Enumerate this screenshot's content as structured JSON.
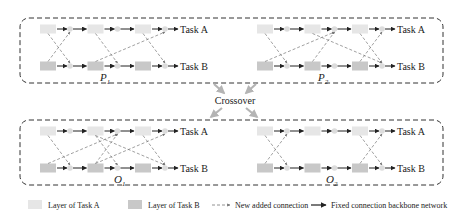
{
  "colors": {
    "layer_a": "#e6e6e6",
    "layer_b": "#c8c8c8",
    "node": "#dcdcdc",
    "border": "#333333",
    "dashed_arrow": "#777777",
    "crossover_arrow": "#b4b4b4",
    "fixed_arrow": "#222222"
  },
  "networks": [
    {
      "id": "P1",
      "label_main": "P",
      "label_sub": "1",
      "outputs": {
        "a": "Task A",
        "b": "Task B"
      },
      "added_connections": [
        {
          "from": [
            "A",
            0
          ],
          "to": [
            "B",
            0
          ]
        },
        {
          "from": [
            "B",
            0
          ],
          "to": [
            "A",
            0
          ]
        },
        {
          "from": [
            "A",
            1
          ],
          "to": [
            "B",
            1
          ]
        },
        {
          "from": [
            "B",
            1
          ],
          "to": [
            "A",
            2
          ]
        },
        {
          "from": [
            "A",
            2
          ],
          "to": [
            "B",
            2
          ]
        }
      ]
    },
    {
      "id": "P2",
      "label_main": "P",
      "label_sub": "2",
      "outputs": {
        "a": "Task A",
        "b": "Task B"
      },
      "added_connections": [
        {
          "from": [
            "A",
            0
          ],
          "to": [
            "B",
            0
          ]
        },
        {
          "from": [
            "B",
            0
          ],
          "to": [
            "A",
            1
          ]
        },
        {
          "from": [
            "B",
            1
          ],
          "to": [
            "A",
            1
          ]
        },
        {
          "from": [
            "A",
            1
          ],
          "to": [
            "B",
            2
          ]
        },
        {
          "from": [
            "A",
            2
          ],
          "to": [
            "B",
            2
          ]
        },
        {
          "from": [
            "B",
            2
          ],
          "to": [
            "A",
            2
          ]
        }
      ]
    },
    {
      "id": "O1",
      "label_main": "O",
      "label_sub": "1",
      "outputs": {
        "a": "Task A",
        "b": "Task B"
      },
      "added_connections": [
        {
          "from": [
            "A",
            0
          ],
          "to": [
            "B",
            0
          ]
        },
        {
          "from": [
            "B",
            0
          ],
          "to": [
            "A",
            1
          ]
        },
        {
          "from": [
            "B",
            1
          ],
          "to": [
            "A",
            1
          ]
        },
        {
          "from": [
            "A",
            1
          ],
          "to": [
            "B",
            1
          ]
        },
        {
          "from": [
            "A",
            1
          ],
          "to": [
            "B",
            2
          ]
        },
        {
          "from": [
            "B",
            1
          ],
          "to": [
            "A",
            2
          ]
        },
        {
          "from": [
            "A",
            2
          ],
          "to": [
            "B",
            2
          ]
        }
      ]
    },
    {
      "id": "O2",
      "label_main": "O",
      "label_sub": "2",
      "outputs": {
        "a": "Task A",
        "b": "Task B"
      },
      "added_connections": [
        {
          "from": [
            "A",
            0
          ],
          "to": [
            "B",
            0
          ]
        },
        {
          "from": [
            "B",
            0
          ],
          "to": [
            "A",
            0
          ]
        },
        {
          "from": [
            "A",
            2
          ],
          "to": [
            "B",
            2
          ]
        },
        {
          "from": [
            "B",
            2
          ],
          "to": [
            "A",
            2
          ]
        }
      ]
    }
  ],
  "crossover_label": "Crossover",
  "legend": {
    "layer_a": "Layer of  Task A",
    "layer_b": "Layer of  Task B",
    "new_connection": "New added connection",
    "fixed_connection": "Fixed connection backbone network"
  }
}
